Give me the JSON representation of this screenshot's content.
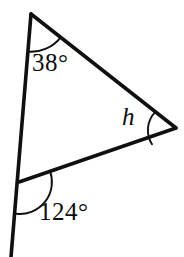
{
  "figure": {
    "type": "geometry-diagram",
    "background_color": "#ffffff",
    "stroke_color": "#101010",
    "canvas": {
      "width": 184,
      "height": 257
    },
    "vertices": {
      "apex": {
        "name": "top-vertex",
        "x": 31,
        "y": 14
      },
      "right": {
        "name": "right-vertex",
        "x": 176,
        "y": 128
      },
      "bottom": {
        "name": "bottom-left-vertex",
        "x": 19,
        "y": 182
      },
      "ray_end": {
        "name": "ray-end-below",
        "x": 11,
        "y": 257
      }
    },
    "segments": [
      {
        "name": "left-side-extended",
        "from": "apex",
        "to": "ray_end"
      },
      {
        "name": "upper-right-side",
        "from": "apex",
        "to": "right"
      },
      {
        "name": "lower-right-side",
        "from": "bottom",
        "to": "right"
      }
    ],
    "labels": {
      "angle_top": "38°",
      "angle_bottom": "124°",
      "angle_right": "h"
    },
    "arcs": [
      {
        "name": "arc-angle-38",
        "at": "apex",
        "radius": 38
      },
      {
        "name": "arc-angle-124",
        "at": "bottom",
        "radius": 32
      },
      {
        "name": "arc-angle-h",
        "at": "right",
        "radius": 26
      }
    ]
  }
}
